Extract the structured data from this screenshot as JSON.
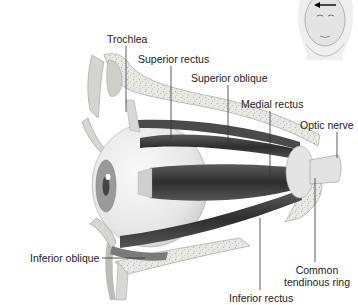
{
  "diagram": {
    "labels": {
      "trochlea": "Trochlea",
      "superior_rectus": "Superior rectus",
      "superior_oblique": "Superior oblique",
      "medial_rectus": "Medial rectus",
      "optic_nerve": "Optic nerve",
      "inferior_oblique": "Inferior oblique",
      "common_tendinous_ring_line1": "Common",
      "common_tendinous_ring_line2": "tendinous ring",
      "inferior_rectus": "Inferior rectus"
    },
    "inset": {
      "description": "head-orientation-inset",
      "arrow": "left-arrow"
    },
    "colors": {
      "background": "#ffffff",
      "bone": "#e6e6e2",
      "bone_speckle": "#b9b9b4",
      "muscle_dark": "#3a3a3a",
      "muscle_mid": "#6a6a6a",
      "eyeball": "#efefef",
      "label_text": "#222222",
      "leader_line": "#333333"
    }
  }
}
